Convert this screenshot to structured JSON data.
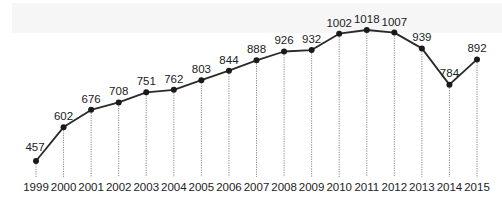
{
  "chart_data": {
    "type": "line",
    "title": "",
    "xlabel": "",
    "ylabel": "",
    "categories": [
      "1999",
      "2000",
      "2001",
      "2002",
      "2003",
      "2004",
      "2005",
      "2006",
      "2007",
      "2008",
      "2009",
      "2010",
      "2011",
      "2012",
      "2013",
      "2014",
      "2015"
    ],
    "values": [
      457,
      602,
      676,
      708,
      751,
      762,
      803,
      844,
      888,
      926,
      932,
      1002,
      1018,
      1007,
      939,
      784,
      892
    ],
    "data_labels": true,
    "drop_lines": "dotted",
    "grid": false,
    "legend": "none",
    "ylim": [
      400,
      1050
    ],
    "colors": {
      "line": "#2a2a2a",
      "marker": "#1a1a1a",
      "drop_line": "#888888"
    }
  }
}
